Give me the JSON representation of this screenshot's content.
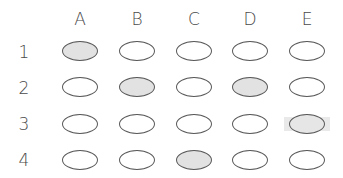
{
  "grid": {
    "columns": [
      "A",
      "B",
      "C",
      "D",
      "E"
    ],
    "rows": [
      "1",
      "2",
      "3",
      "4"
    ],
    "colors": {
      "bubble_stroke": "#5a5a5a",
      "bubble_filled": "#e2e2e2",
      "bubble_empty": "#ffffff",
      "highlight_band": "#e9e9e9"
    },
    "cells": [
      {
        "row": "1",
        "col": "A",
        "state": "filled"
      },
      {
        "row": "1",
        "col": "B",
        "state": "empty"
      },
      {
        "row": "1",
        "col": "C",
        "state": "empty"
      },
      {
        "row": "1",
        "col": "D",
        "state": "empty"
      },
      {
        "row": "1",
        "col": "E",
        "state": "empty"
      },
      {
        "row": "2",
        "col": "A",
        "state": "empty"
      },
      {
        "row": "2",
        "col": "B",
        "state": "filled"
      },
      {
        "row": "2",
        "col": "C",
        "state": "empty"
      },
      {
        "row": "2",
        "col": "D",
        "state": "filled"
      },
      {
        "row": "2",
        "col": "E",
        "state": "empty"
      },
      {
        "row": "3",
        "col": "A",
        "state": "empty"
      },
      {
        "row": "3",
        "col": "B",
        "state": "empty"
      },
      {
        "row": "3",
        "col": "C",
        "state": "empty"
      },
      {
        "row": "3",
        "col": "D",
        "state": "empty"
      },
      {
        "row": "3",
        "col": "E",
        "state": "highlighted"
      },
      {
        "row": "4",
        "col": "A",
        "state": "empty"
      },
      {
        "row": "4",
        "col": "B",
        "state": "empty"
      },
      {
        "row": "4",
        "col": "C",
        "state": "filled"
      },
      {
        "row": "4",
        "col": "D",
        "state": "empty"
      },
      {
        "row": "4",
        "col": "E",
        "state": "empty"
      }
    ]
  }
}
